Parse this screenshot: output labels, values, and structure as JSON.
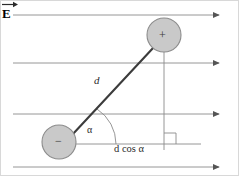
{
  "figure": {
    "background_color": "#ffffff",
    "border_color": "#d8d8d8",
    "line_color": "#8a8a8a",
    "dipole_color": "#4a4a4a",
    "charge_fill": "#c9c9c9",
    "charge_stroke": "#8c8c8c",
    "text_color": "#2b2b2b"
  },
  "field": {
    "label": "E",
    "vector_label_name": "electric-field-vector-E",
    "direction": "right",
    "line_count": 4,
    "lines": [
      {
        "y": 14,
        "x_start": 12,
        "x_end": 220
      },
      {
        "y": 62,
        "x_start": 12,
        "x_end": 220
      },
      {
        "y": 113,
        "x_start": 12,
        "x_end": 220
      },
      {
        "y": 166,
        "x_start": 12,
        "x_end": 220
      }
    ]
  },
  "charges": [
    {
      "sign": "+",
      "name": "positive-charge",
      "cx": 163,
      "cy": 34,
      "r": 17
    },
    {
      "sign": "−",
      "name": "negative-charge",
      "cx": 58,
      "cy": 141,
      "r": 17
    }
  ],
  "annotations": {
    "separation_label": "d",
    "angle_label": "α",
    "projection_label": "d cos α",
    "right_angle_marker": true
  },
  "geometry": {
    "dipole_axis": {
      "x1": 72,
      "y1": 134,
      "x2": 152,
      "y2": 46
    },
    "baseline": {
      "x1": 58,
      "y1": 143,
      "x2": 200,
      "y2": 143
    },
    "dropline": {
      "x": 163,
      "y1": 51,
      "y2": 148
    },
    "angle_arc_radius": 42,
    "right_angle_size": 11
  }
}
